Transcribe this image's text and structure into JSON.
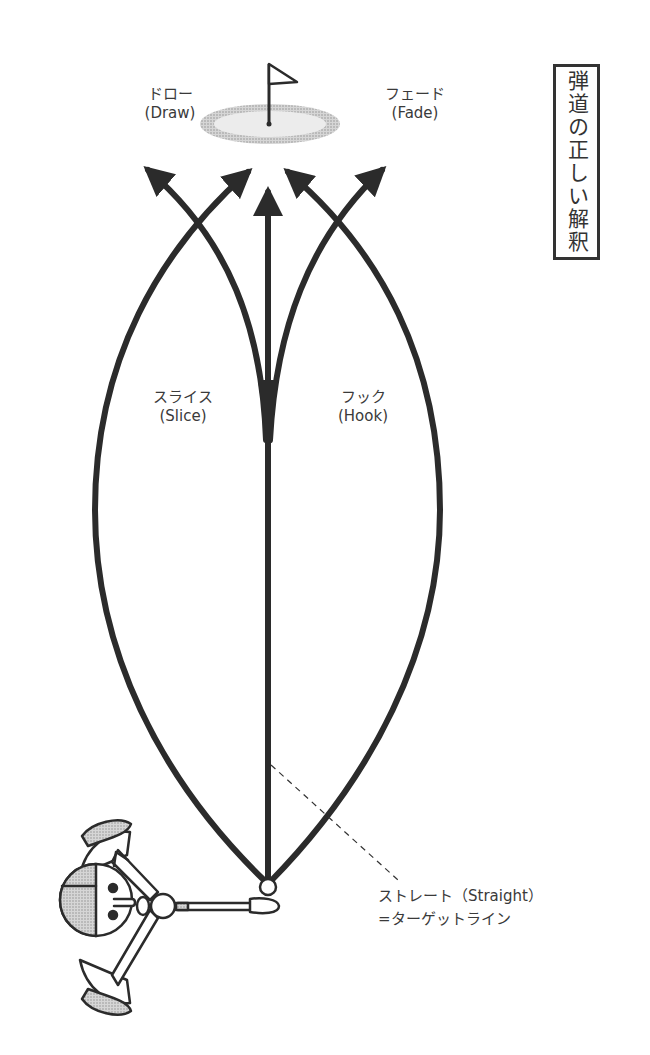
{
  "title": "弾道の正しい解釈",
  "labels": {
    "draw": {
      "jp": "ドロー",
      "en": "(Draw)"
    },
    "fade": {
      "jp": "フェード",
      "en": "(Fade)"
    },
    "slice": {
      "jp": "スライス",
      "en": "(Slice)"
    },
    "hook": {
      "jp": "フック",
      "en": "(Hook)"
    },
    "straight": {
      "jp": "ストレート（Straight）",
      "sub": "=ターゲットライン"
    }
  },
  "colors": {
    "line": "#2b2b2b",
    "green_outer": "#c8c8c8",
    "green_inner": "#ececec",
    "hatch": "#bdbdbd",
    "background": "#ffffff"
  },
  "elements": {
    "target": "flag-on-green",
    "origin": "golf-ball",
    "golfer": "golfer-top-view"
  }
}
